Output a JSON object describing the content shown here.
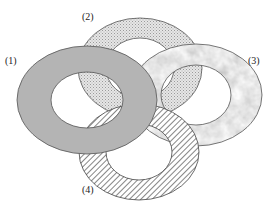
{
  "diagram": {
    "type": "overlapping-rings",
    "rings": [
      {
        "id": "1",
        "label": "(1)",
        "fill": "solid-gray",
        "color": "#b4b4b4",
        "cx": 87,
        "cy": 100,
        "outer_rx": 70,
        "outer_ry": 54,
        "inner_rx": 36,
        "inner_ry": 28,
        "label_x": 5,
        "label_y": 64
      },
      {
        "id": "2",
        "label": "(2)",
        "fill": "dotted",
        "color": "#dcdcdc",
        "cx": 140,
        "cy": 68,
        "outer_rx": 62,
        "outer_ry": 50,
        "inner_rx": 34,
        "inner_ry": 30,
        "label_x": 82,
        "label_y": 20
      },
      {
        "id": "3",
        "label": "(3)",
        "fill": "marble",
        "color": "#c8c8c8",
        "cx": 196,
        "cy": 95,
        "outer_rx": 66,
        "outer_ry": 51,
        "inner_rx": 35,
        "inner_ry": 30,
        "label_x": 248,
        "label_y": 64
      },
      {
        "id": "4",
        "label": "(4)",
        "fill": "hatched",
        "color": "#555555",
        "cx": 139,
        "cy": 152,
        "outer_rx": 60,
        "outer_ry": 48,
        "inner_rx": 33,
        "inner_ry": 28,
        "label_x": 82,
        "label_y": 193
      }
    ],
    "stacking_order_bottom_to_top": [
      "2",
      "3",
      "4",
      "1"
    ]
  }
}
